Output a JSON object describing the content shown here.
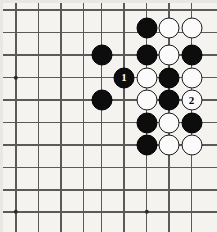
{
  "diagram": {
    "board_style": "grid-fragment",
    "background_color": "#f4f3f0",
    "line_color": "#5a5a5a",
    "black_stone_color": "#0d0d0d",
    "white_stone_color": "#fbfbfb",
    "stone_diameter": 21,
    "cell_size": 22.5
  },
  "grid": {
    "vertical_x": [
      16,
      38.5,
      61,
      83.5,
      101.5,
      124,
      146.5,
      169,
      191.5
    ],
    "horizontal_y": [
      10,
      32.5,
      55,
      77.5,
      100,
      122.5,
      145,
      167.5,
      190,
      212
    ],
    "star_points": [
      {
        "x": 16,
        "y": 77.5
      },
      {
        "x": 16,
        "y": 212
      },
      {
        "x": 146.5,
        "y": 212
      }
    ]
  },
  "stones": [
    {
      "x": 146.5,
      "y": 28,
      "color": "black",
      "label": ""
    },
    {
      "x": 169,
      "y": 28,
      "color": "white",
      "label": ""
    },
    {
      "x": 191.5,
      "y": 28,
      "color": "white",
      "label": ""
    },
    {
      "x": 101.5,
      "y": 55,
      "color": "black",
      "label": ""
    },
    {
      "x": 146.5,
      "y": 55,
      "color": "black",
      "label": ""
    },
    {
      "x": 169,
      "y": 55,
      "color": "white",
      "label": ""
    },
    {
      "x": 191.5,
      "y": 55,
      "color": "black",
      "label": ""
    },
    {
      "x": 124,
      "y": 77.5,
      "color": "black",
      "label": "1"
    },
    {
      "x": 146.5,
      "y": 77.5,
      "color": "white",
      "label": ""
    },
    {
      "x": 169,
      "y": 77.5,
      "color": "black",
      "label": ""
    },
    {
      "x": 191.5,
      "y": 77.5,
      "color": "white",
      "label": ""
    },
    {
      "x": 101.5,
      "y": 100,
      "color": "black",
      "label": ""
    },
    {
      "x": 146.5,
      "y": 100,
      "color": "white",
      "label": ""
    },
    {
      "x": 169,
      "y": 100,
      "color": "black",
      "label": ""
    },
    {
      "x": 191.5,
      "y": 100,
      "color": "white",
      "label": "2"
    },
    {
      "x": 146.5,
      "y": 122.5,
      "color": "black",
      "label": ""
    },
    {
      "x": 169,
      "y": 122.5,
      "color": "white",
      "label": ""
    },
    {
      "x": 191.5,
      "y": 122.5,
      "color": "black",
      "label": ""
    },
    {
      "x": 146.5,
      "y": 145,
      "color": "black",
      "label": ""
    },
    {
      "x": 169,
      "y": 145,
      "color": "white",
      "label": ""
    },
    {
      "x": 191.5,
      "y": 145,
      "color": "white",
      "label": ""
    }
  ],
  "move_markers": [
    {
      "number": "1",
      "color": "black",
      "label_color": "#ffffff"
    },
    {
      "number": "2",
      "color": "white",
      "label_color": "#000000"
    }
  ]
}
